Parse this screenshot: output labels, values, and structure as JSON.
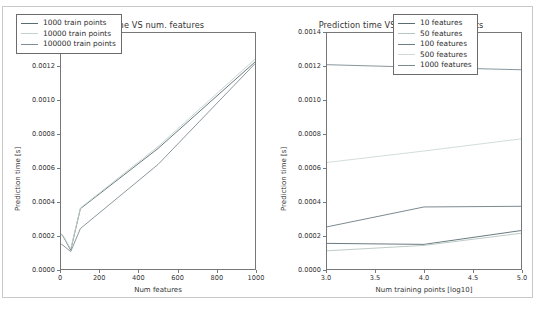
{
  "figure": {
    "background": "#ffffff",
    "frame_color": "#c9c9c9",
    "axes_color": "#777777"
  },
  "chart_data": [
    {
      "type": "line",
      "panel": "left",
      "title": "Prediction time VS num. features",
      "xlabel": "Num features",
      "ylabel": "Prediction time [s]",
      "xlim": [
        0,
        1000
      ],
      "ylim": [
        0.0,
        0.0014
      ],
      "xticks": [
        0,
        200,
        400,
        600,
        800,
        1000
      ],
      "xticklabels": [
        "0",
        "200",
        "400",
        "600",
        "800",
        "1000"
      ],
      "yticks": [
        0.0,
        0.0002,
        0.0004,
        0.0006,
        0.0008,
        0.001,
        0.0012,
        0.0014
      ],
      "yticklabels": [
        "0.0000",
        "0.0002",
        "0.0004",
        "0.0006",
        "0.0008",
        "0.0010",
        "0.0012",
        "0.0014"
      ],
      "grid": false,
      "legend_position": "upper left",
      "x": [
        1,
        10,
        50,
        100,
        500,
        1000
      ],
      "series": [
        {
          "name": "1000 train points",
          "color": "#5a6b72",
          "values": [
            0.000205,
            0.000196,
            0.000112,
            0.000358,
            0.000715,
            0.001228
          ]
        },
        {
          "name": "10000 train points",
          "color": "#c2d2cc",
          "values": [
            0.000208,
            0.0002,
            0.000118,
            0.000362,
            0.000726,
            0.001245
          ]
        },
        {
          "name": "100000 train points",
          "color": "#7f8c93",
          "values": [
            0.000148,
            0.000141,
            0.000103,
            0.00024,
            0.00062,
            0.001218
          ]
        }
      ]
    },
    {
      "type": "line",
      "panel": "right",
      "title": "Prediction time VS num. training points",
      "xlabel": "Num training points [log10]",
      "ylabel": "Prediction time [s]",
      "xlim": [
        3.0,
        5.0
      ],
      "ylim": [
        0.0,
        0.0014
      ],
      "xticks": [
        3.0,
        3.5,
        4.0,
        4.5,
        5.0
      ],
      "xticklabels": [
        "3.0",
        "3.5",
        "4.0",
        "4.5",
        "5.0"
      ],
      "yticks": [
        0.0,
        0.0002,
        0.0004,
        0.0006,
        0.0008,
        0.001,
        0.0012,
        0.0014
      ],
      "yticklabels": [
        "0.0000",
        "0.0002",
        "0.0004",
        "0.0006",
        "0.0008",
        "0.0010",
        "0.0012",
        "0.0014"
      ],
      "grid": false,
      "legend_position": "upper right",
      "x": [
        3.0,
        4.0,
        5.0
      ],
      "series": [
        {
          "name": "10 features",
          "color": "#5a6b72",
          "values": [
            0.000152,
            0.000146,
            0.000228
          ]
        },
        {
          "name": "50 features",
          "color": "#b6c6c1",
          "values": [
            0.000108,
            0.00014,
            0.000212
          ]
        },
        {
          "name": "100 features",
          "color": "#6d7d84",
          "values": [
            0.00025,
            0.000368,
            0.000372
          ]
        },
        {
          "name": "500 features",
          "color": "#cdd9d4",
          "values": [
            0.000632,
            0.0007,
            0.000772
          ]
        },
        {
          "name": "1000 features",
          "color": "#7a8a91",
          "values": [
            0.001212,
            0.001196,
            0.001182
          ]
        }
      ]
    }
  ]
}
